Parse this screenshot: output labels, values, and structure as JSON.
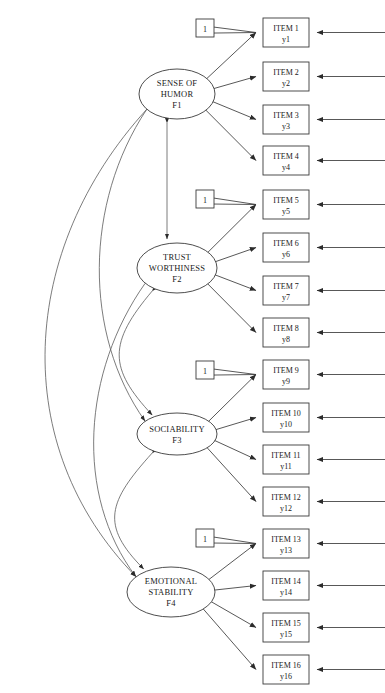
{
  "diagram": {
    "type": "sem-path-diagram",
    "colors": {
      "stroke": "#3a3a3a",
      "curve": "#5a5a5a",
      "fill": "#ffffff"
    }
  },
  "factors": [
    {
      "id": "F1",
      "lines": [
        "SENSE OF",
        "HUMOR",
        "F1"
      ],
      "cx": 177,
      "cy": 94,
      "rx": 38,
      "ry": 25
    },
    {
      "id": "F2",
      "lines": [
        "TRUST",
        "WORTHINESS",
        "F2"
      ],
      "cx": 177,
      "cy": 268,
      "rx": 40,
      "ry": 25
    },
    {
      "id": "F3",
      "lines": [
        "SOCIABILITY",
        "F3"
      ],
      "cx": 177,
      "cy": 434,
      "rx": 40,
      "ry": 21
    },
    {
      "id": "F4",
      "lines": [
        "EMOTIONAL",
        "STABILITY",
        "F4"
      ],
      "cx": 171,
      "cy": 592,
      "rx": 44,
      "ry": 25
    }
  ],
  "items": [
    {
      "label": "ITEM 1",
      "var": "y1",
      "x": 263,
      "y": 18,
      "factor": "F1"
    },
    {
      "label": "ITEM 2",
      "var": "y2",
      "x": 263,
      "y": 62,
      "factor": "F1"
    },
    {
      "label": "ITEM 3",
      "var": "y3",
      "x": 263,
      "y": 105,
      "factor": "F1"
    },
    {
      "label": "ITEM 4",
      "var": "y4",
      "x": 263,
      "y": 146,
      "factor": "F1"
    },
    {
      "label": "ITEM 5",
      "var": "y5",
      "x": 263,
      "y": 190,
      "factor": "F2"
    },
    {
      "label": "ITEM 6",
      "var": "y6",
      "x": 263,
      "y": 233,
      "factor": "F2"
    },
    {
      "label": "ITEM 7",
      "var": "y7",
      "x": 263,
      "y": 276,
      "factor": "F2"
    },
    {
      "label": "ITEM 8",
      "var": "y8",
      "x": 263,
      "y": 318,
      "factor": "F2"
    },
    {
      "label": "ITEM 9",
      "var": "y9",
      "x": 263,
      "y": 360,
      "factor": "F3"
    },
    {
      "label": "ITEM 10",
      "var": "y10",
      "x": 263,
      "y": 403,
      "factor": "F3"
    },
    {
      "label": "ITEM 11",
      "var": "y11",
      "x": 263,
      "y": 445,
      "factor": "F3"
    },
    {
      "label": "ITEM 12",
      "var": "y12",
      "x": 263,
      "y": 487,
      "factor": "F3"
    },
    {
      "label": "ITEM 13",
      "var": "y13",
      "x": 263,
      "y": 529,
      "factor": "F4"
    },
    {
      "label": "ITEM 14",
      "var": "y14",
      "x": 263,
      "y": 571,
      "factor": "F4"
    },
    {
      "label": "ITEM 15",
      "var": "y15",
      "x": 263,
      "y": 613,
      "factor": "F4"
    },
    {
      "label": "ITEM 16",
      "var": "y16",
      "x": 263,
      "y": 655,
      "factor": "F4"
    }
  ],
  "fixed_markers": [
    {
      "value": "1",
      "x": 196,
      "y": 19,
      "factor": "F1"
    },
    {
      "value": "1",
      "x": 196,
      "y": 190,
      "factor": "F2"
    },
    {
      "value": "1",
      "x": 196,
      "y": 361,
      "factor": "F3"
    },
    {
      "value": "1",
      "x": 196,
      "y": 529,
      "factor": "F4"
    }
  ],
  "correlations": [
    {
      "from": "F1",
      "to": "F2"
    },
    {
      "from": "F2",
      "to": "F3"
    },
    {
      "from": "F3",
      "to": "F4"
    },
    {
      "from": "F1",
      "to": "F3"
    },
    {
      "from": "F2",
      "to": "F4"
    },
    {
      "from": "F1",
      "to": "F4"
    }
  ],
  "geometry": {
    "item_box_w": 46,
    "item_box_h": 29,
    "marker_box": 18,
    "residual_arrow_start_x": 385,
    "residual_arrow_end_offset": 8
  }
}
